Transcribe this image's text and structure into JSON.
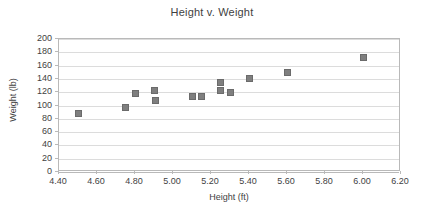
{
  "chart_data": {
    "type": "scatter",
    "title": "Height v. Weight",
    "xlabel": "Height (ft)",
    "ylabel": "Weight (lb)",
    "xlim": [
      4.4,
      6.2
    ],
    "ylim": [
      0,
      200
    ],
    "x_tick_step": 0.2,
    "y_tick_step": 20,
    "x_tick_labels": [
      "4.40",
      "4.60",
      "4.80",
      "5.00",
      "5.20",
      "5.40",
      "5.60",
      "5.80",
      "6.00",
      "6.20"
    ],
    "x_tick_values": [
      4.4,
      4.6,
      4.8,
      5.0,
      5.2,
      5.4,
      5.6,
      5.8,
      6.0,
      6.2
    ],
    "y_tick_labels": [
      "0",
      "20",
      "40",
      "60",
      "80",
      "100",
      "120",
      "140",
      "160",
      "180",
      "200"
    ],
    "y_tick_values": [
      0,
      20,
      40,
      60,
      80,
      100,
      120,
      140,
      160,
      180,
      200
    ],
    "grid": "horizontal",
    "legend": "none",
    "marker_color": "#7f7f7f",
    "marker_shape": "square",
    "series": [
      {
        "name": "Height v. Weight",
        "points": [
          {
            "x": 4.5,
            "y": 88
          },
          {
            "x": 4.75,
            "y": 97
          },
          {
            "x": 4.8,
            "y": 118
          },
          {
            "x": 4.9,
            "y": 122
          },
          {
            "x": 4.91,
            "y": 107
          },
          {
            "x": 5.1,
            "y": 114
          },
          {
            "x": 5.15,
            "y": 114
          },
          {
            "x": 5.25,
            "y": 135
          },
          {
            "x": 5.25,
            "y": 123
          },
          {
            "x": 5.3,
            "y": 120
          },
          {
            "x": 5.4,
            "y": 141
          },
          {
            "x": 5.6,
            "y": 149
          },
          {
            "x": 6.0,
            "y": 172
          }
        ]
      }
    ]
  }
}
